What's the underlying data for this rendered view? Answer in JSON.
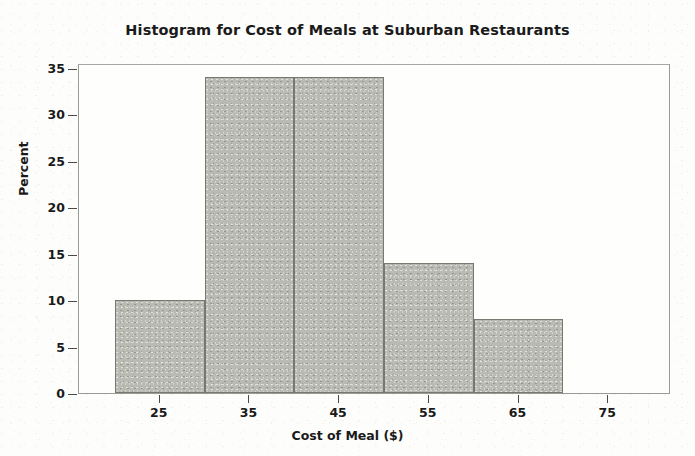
{
  "chart_data": {
    "type": "bar",
    "title": "Histogram for Cost of Meals at Suburban Restaurants",
    "xlabel": "Cost of Meal ($)",
    "ylabel": "Percent",
    "categories": [
      "20-30",
      "30-40",
      "40-50",
      "50-60",
      "60-70"
    ],
    "bin_edges": [
      20,
      30,
      40,
      50,
      60,
      70
    ],
    "values": [
      10,
      34,
      34,
      14,
      8
    ],
    "bin_width": 10,
    "xlim": [
      16,
      82
    ],
    "ylim": [
      0,
      35.5
    ],
    "xticks": [
      25,
      35,
      45,
      55,
      65,
      75
    ],
    "xtick_labels": [
      "25",
      "35",
      "45",
      "55",
      "65",
      "75"
    ],
    "yticks": [
      0,
      5,
      10,
      15,
      20,
      25,
      30,
      35
    ],
    "ytick_labels": [
      "0",
      "5",
      "10",
      "15",
      "20",
      "25",
      "30",
      "35"
    ],
    "grid": false,
    "legend": false,
    "bar_fill_color": "#b9bbb3",
    "bar_border_color": "#77786f",
    "background_color": "#fdfdfb",
    "text_color": "#1a1a1a"
  }
}
